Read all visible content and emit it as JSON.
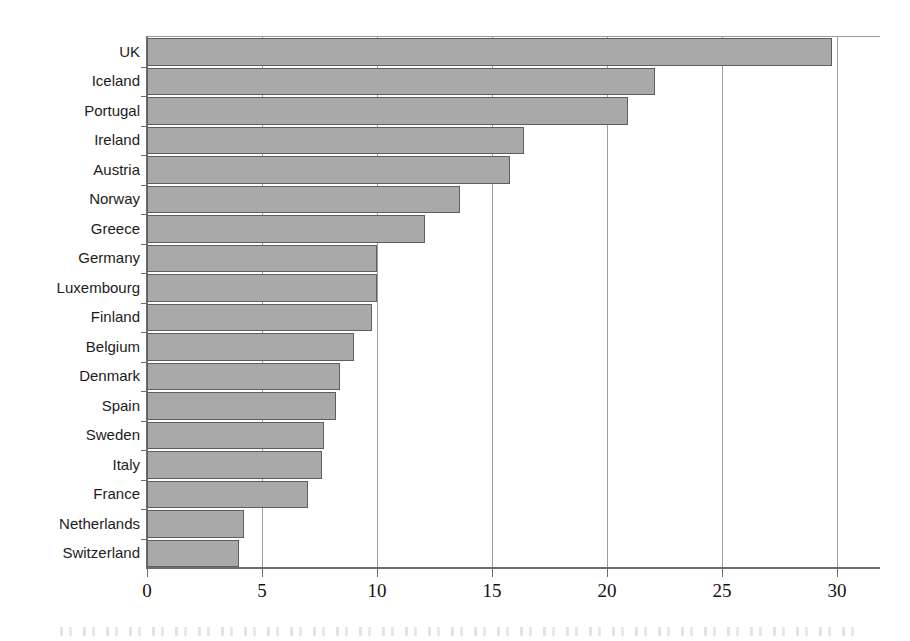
{
  "chart_data": {
    "type": "bar",
    "orientation": "horizontal",
    "title": "",
    "subtitle": "",
    "xlabel": "",
    "ylabel": "",
    "xlim": [
      0,
      30
    ],
    "xticks": [
      0,
      5,
      10,
      15,
      20,
      25,
      30
    ],
    "xtick_labels": [
      "0",
      "5",
      "10",
      "15",
      "20",
      "25",
      "30"
    ],
    "grid": "vertical",
    "legend": "none",
    "bar_color": "#a9a9a9",
    "bar_edge_color": "#5e5e5e",
    "axis_color": "#6d6d6d",
    "gridline_color": "#9d9d9d",
    "background_color": "#ffffff",
    "categories": [
      "UK",
      "Iceland",
      "Portugal",
      "Ireland",
      "Austria",
      "Norway",
      "Greece",
      "Germany",
      "Luxembourg",
      "Finland",
      "Belgium",
      "Denmark",
      "Spain",
      "Sweden",
      "Italy",
      "France",
      "Netherlands",
      "Switzerland"
    ],
    "values": [
      29.8,
      22.1,
      20.9,
      16.4,
      15.8,
      13.6,
      12.1,
      10.0,
      10.0,
      9.8,
      9.0,
      8.4,
      8.2,
      7.7,
      7.6,
      7.0,
      4.2,
      4.0
    ]
  }
}
